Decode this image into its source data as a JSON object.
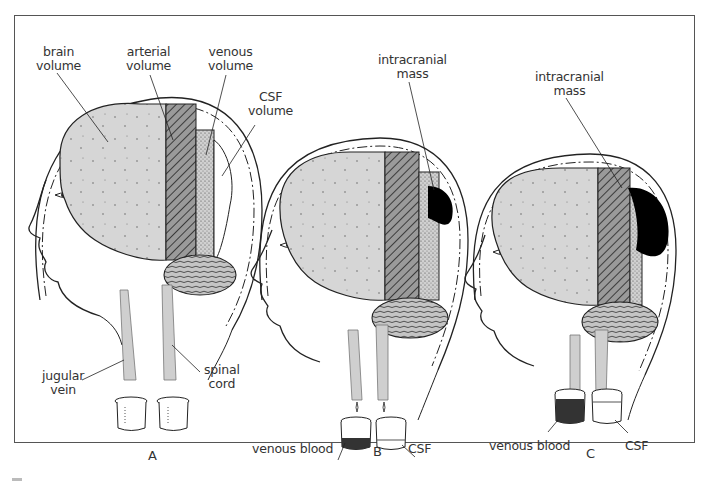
{
  "figure": {
    "panels": [
      {
        "letter": "A",
        "labels": {
          "brain": "brain\nvolume",
          "arterial": "arterial\nvolume",
          "venous": "venous\nvolume",
          "csf": "CSF\nvolume",
          "jugular": "jugular\nvein",
          "spinal": "spinal\ncord"
        }
      },
      {
        "letter": "B",
        "labels": {
          "mass": "intracranial\nmass",
          "venous_blood": "venous blood",
          "csf": "CSF"
        }
      },
      {
        "letter": "C",
        "labels": {
          "mass": "intracranial\nmass",
          "venous_blood": "venous blood",
          "csf": "CSF"
        }
      }
    ],
    "colors": {
      "brain_fill": "#d4d4d4",
      "arterial_fill": "#8a8a8a",
      "venous_fill": "#c8c8c8",
      "mass_fill": "#000000",
      "outline": "#222222",
      "frame": "#555555"
    }
  }
}
